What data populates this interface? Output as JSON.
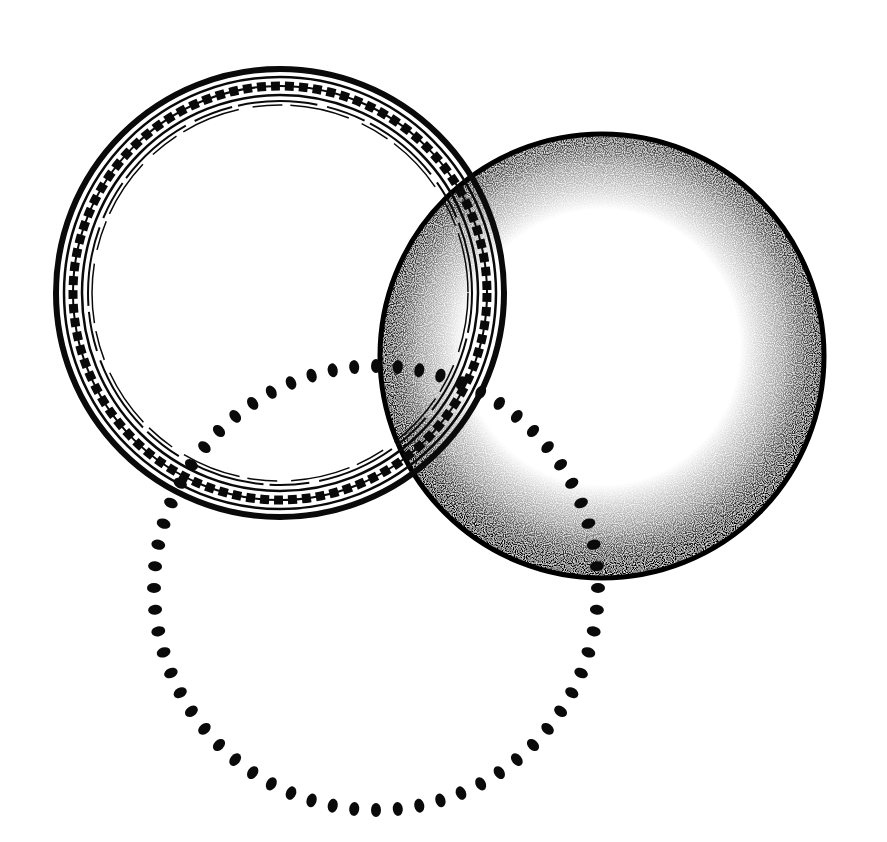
{
  "illustration": {
    "title": "Three overlapping circles",
    "background": "#ffffff",
    "ink": "#0a0a0a",
    "shapes": [
      {
        "name": "beaded-ring",
        "style": "double outline with chain of beads",
        "cx": 280,
        "cy": 293,
        "r": 222
      },
      {
        "name": "stippled-sphere",
        "style": "stippled shading darkening toward edge",
        "cx": 602,
        "cy": 356,
        "r": 222
      },
      {
        "name": "dotted-circle",
        "style": "ring of ink dots",
        "cx": 376,
        "cy": 588,
        "r": 222,
        "dot_count": 64
      }
    ]
  }
}
